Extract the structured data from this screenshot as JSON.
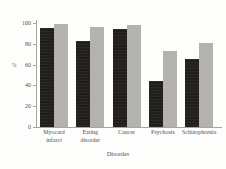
{
  "colors": {
    "background": "#fdfdfc",
    "axis": "#a6a5a2",
    "text": "#55534f",
    "dark_bar": "#211f1d",
    "light_bar": "#b3b2af"
  },
  "chart_data": {
    "type": "bar",
    "title": "",
    "xlabel": "Disorder",
    "ylabel": "%",
    "ylim": [
      0,
      100
    ],
    "yticks": [
      0,
      20,
      40,
      60,
      80,
      100
    ],
    "grid": false,
    "legend_position": "none",
    "categories": [
      "Myocard infarct",
      "Eating disorder",
      "Cancer",
      "Psychosis",
      "Schizophrenia"
    ],
    "category_label_lines": [
      [
        "Myocard",
        "infarct"
      ],
      [
        "Eating",
        "disorder"
      ],
      [
        "Cancer"
      ],
      [
        "Psychosis"
      ],
      [
        "Schizophrenia"
      ]
    ],
    "series": [
      {
        "name": "black-bars",
        "color": "#211f1d",
        "values": [
          96,
          83,
          95,
          45,
          66
        ]
      },
      {
        "name": "gray-bars",
        "color": "#b3b2af",
        "values": [
          100,
          97,
          99,
          74,
          81
        ]
      }
    ]
  }
}
